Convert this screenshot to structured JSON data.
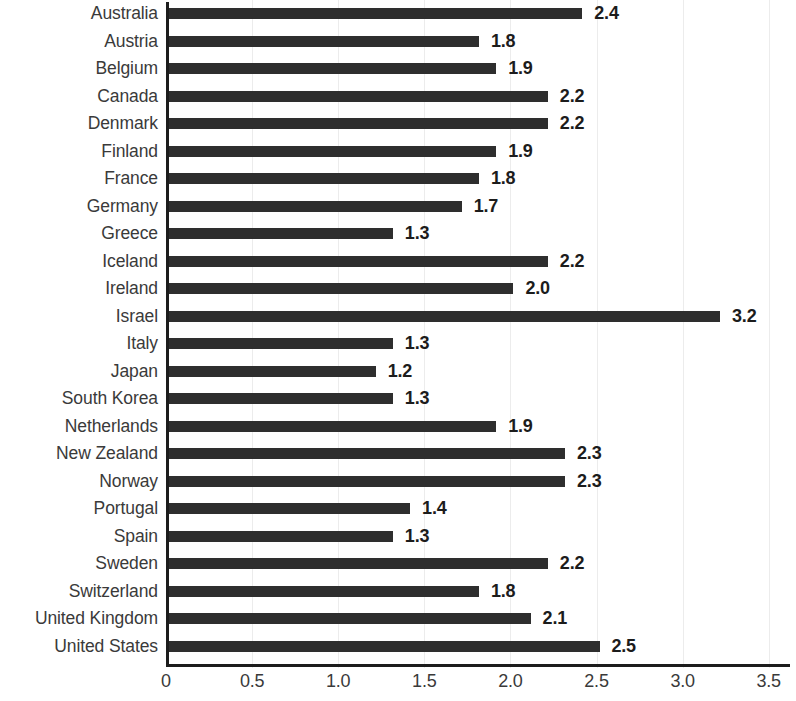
{
  "chart_data": {
    "type": "bar",
    "orientation": "horizontal",
    "title": "",
    "subtitle": "",
    "xlabel": "",
    "ylabel": "",
    "xlim": [
      0,
      3.5
    ],
    "xticks": [
      "0",
      "0.5",
      "1.0",
      "1.5",
      "2.0",
      "2.5",
      "3.0",
      "3.5"
    ],
    "xtick_values": [
      0,
      0.5,
      1.0,
      1.5,
      2.0,
      2.5,
      3.0,
      3.5
    ],
    "grid": "vertical-faint",
    "legend": "none",
    "bar_color": "#2e2e2e",
    "categories": [
      "Australia",
      "Austria",
      "Belgium",
      "Canada",
      "Denmark",
      "Finland",
      "France",
      "Germany",
      "Greece",
      "Iceland",
      "Ireland",
      "Israel",
      "Italy",
      "Japan",
      "South Korea",
      "Netherlands",
      "New Zealand",
      "Norway",
      "Portugal",
      "Spain",
      "Sweden",
      "Switzerland",
      "United Kingdom",
      "United States"
    ],
    "values": [
      2.4,
      1.8,
      1.9,
      2.2,
      2.2,
      1.9,
      1.8,
      1.7,
      1.3,
      2.2,
      2.0,
      3.2,
      1.3,
      1.2,
      1.3,
      1.9,
      2.3,
      2.3,
      1.4,
      1.3,
      2.2,
      1.8,
      2.1,
      2.5
    ],
    "data_labels": [
      "2.4",
      "1.8",
      "1.9",
      "2.2",
      "2.2",
      "1.9",
      "1.8",
      "1.7",
      "1.3",
      "2.2",
      "2.0",
      "3.2",
      "1.3",
      "1.2",
      "1.3",
      "1.9",
      "2.3",
      "2.3",
      "1.4",
      "1.3",
      "2.2",
      "1.8",
      "2.1",
      "2.5"
    ]
  }
}
